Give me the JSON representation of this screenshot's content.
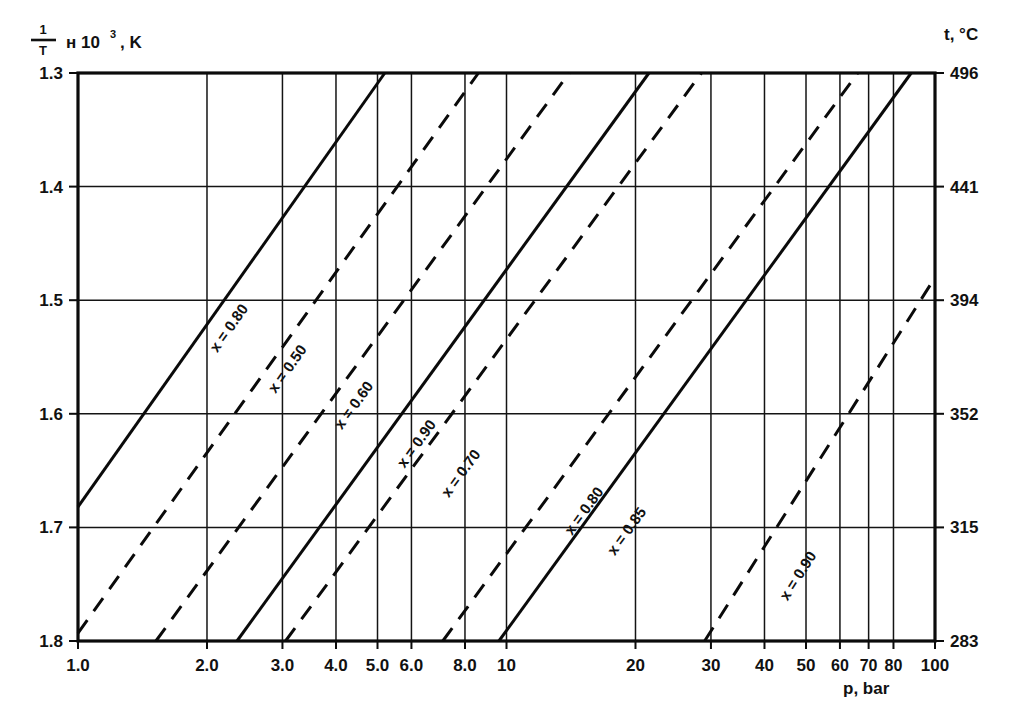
{
  "chart_data": {
    "type": "line",
    "title": "",
    "xlabel": "p, bar",
    "ylabel": "1/T x 10^3 , K",
    "ylabel_parts": {
      "numerator": "1",
      "denominator": "T",
      "multiplier": "н 10",
      "exponent": "3",
      "unit": ", K"
    },
    "right_axis_label": "t, °C",
    "xscale": "log",
    "xlim": [
      1.0,
      100.0
    ],
    "ylim": [
      1.3,
      1.8
    ],
    "y_inverted": true,
    "grid": true,
    "legend": "inline-labels",
    "xticks": [
      "1.0",
      "2.0",
      "3.0",
      "4.0",
      "5.0",
      "6.0",
      "8.0",
      "10",
      "20",
      "30",
      "40",
      "50",
      "60",
      "70",
      "80",
      "100"
    ],
    "xtick_values": [
      1.0,
      2.0,
      3.0,
      4.0,
      5.0,
      6.0,
      8.0,
      10,
      20,
      30,
      40,
      50,
      60,
      70,
      80,
      100
    ],
    "yticks": [
      "1.3",
      "1.4",
      "1.5",
      "1.6",
      "1.7",
      "1.8"
    ],
    "ytick_values": [
      1.3,
      1.4,
      1.5,
      1.6,
      1.7,
      1.8
    ],
    "right_ticks": [
      "496",
      "441",
      "394",
      "352",
      "315",
      "283"
    ],
    "right_tick_values": [
      496,
      441,
      394,
      352,
      315,
      283
    ],
    "major_gridlines_x": [
      1.0,
      2.0,
      3.0,
      4.0,
      5.0,
      6.0,
      8.0,
      10,
      20,
      30,
      40,
      50,
      60,
      70,
      80,
      100
    ],
    "series": [
      {
        "name": "x = 0.80",
        "label": "x = 0.80",
        "style": "solid",
        "p_start": 1.0,
        "y_start": 1.682,
        "p_end": 5.2,
        "y_end": 1.3,
        "label_p": 2.3,
        "label_y": 1.527
      },
      {
        "name": "x = 0.50",
        "label": "x = 0.50",
        "style": "dashed",
        "p_start": 1.0,
        "y_start": 1.793,
        "p_end": 8.6,
        "y_end": 1.3,
        "label_p": 3.15,
        "label_y": 1.563
      },
      {
        "name": "x = 0.60",
        "label": "x = 0.60",
        "style": "dashed",
        "p_start": 1.52,
        "y_start": 1.8,
        "p_end": 14.0,
        "y_end": 1.3,
        "label_p": 4.5,
        "label_y": 1.595
      },
      {
        "name": "x = 0.90-solid",
        "label": "x = 0.90",
        "style": "solid",
        "p_start": 2.35,
        "y_start": 1.8,
        "p_end": 21.5,
        "y_end": 1.3,
        "label_p": 6.3,
        "label_y": 1.629
      },
      {
        "name": "x = 0.70",
        "label": "x = 0.70",
        "style": "dashed",
        "p_start": 3.05,
        "y_start": 1.8,
        "p_end": 28.5,
        "y_end": 1.3,
        "label_p": 8.0,
        "label_y": 1.655
      },
      {
        "name": "x = 0.80-dashed",
        "label": "x = 0.80",
        "style": "dashed",
        "p_start": 7.1,
        "y_start": 1.8,
        "p_end": 66.0,
        "y_end": 1.3,
        "label_p": 15.5,
        "label_y": 1.688
      },
      {
        "name": "x = 0.85",
        "label": "x = 0.85",
        "style": "solid",
        "p_start": 9.6,
        "y_start": 1.8,
        "p_end": 88.0,
        "y_end": 1.3,
        "label_p": 19.5,
        "label_y": 1.706
      },
      {
        "name": "x = 0.90-dashed",
        "label": "x = 0.90",
        "style": "dashed",
        "p_start": 29.0,
        "y_start": 1.8,
        "p_end": 100.0,
        "y_end": 1.48,
        "label_p": 49.0,
        "label_y": 1.745
      }
    ]
  },
  "labels": {
    "y_axis_caption": "н 10",
    "y_axis_exponent": "3",
    "y_axis_unit": ", K",
    "frac_numerator": "1",
    "frac_denominator": "T",
    "right_axis_caption": "t, °C",
    "x_axis_caption": "p, bar"
  }
}
